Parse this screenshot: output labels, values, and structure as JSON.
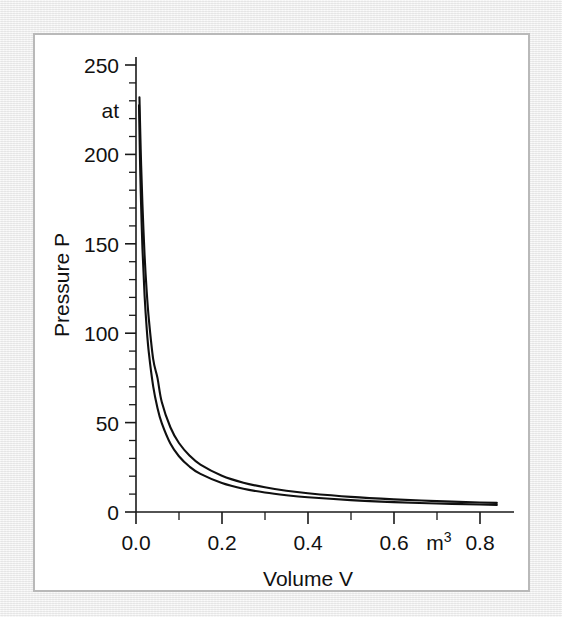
{
  "figure": {
    "background_color": "#ffffff",
    "frame_color": "#b9b9b9",
    "margin_color": "#eeeeee",
    "ink_color": "#101010"
  },
  "chart_data": {
    "type": "line",
    "title": "",
    "subtitle": "",
    "xlabel": "Volume V",
    "ylabel": "Pressure P",
    "x_unit": "m",
    "x_unit_exponent": "3",
    "y_unit": "at",
    "xlim": [
      0.0,
      0.88
    ],
    "ylim": [
      0,
      258
    ],
    "grid": false,
    "legend": "none",
    "x_ticks": [
      0.0,
      0.2,
      0.4,
      0.6,
      0.8
    ],
    "x_tick_labels": [
      "0.0",
      "0.2",
      "0.4",
      "0.6",
      "0.8"
    ],
    "x_minor_step": 0.1,
    "y_ticks": [
      0,
      50,
      100,
      150,
      200,
      250
    ],
    "y_tick_labels": [
      "0",
      "50",
      "100",
      "150",
      "200",
      "250"
    ],
    "y_minor_step": 10,
    "annotations": [
      {
        "text": "at",
        "role": "y-axis-unit",
        "x": 0.0,
        "y": 225
      },
      {
        "text": "m3",
        "role": "x-axis-unit",
        "x": 0.695,
        "y": 0
      }
    ],
    "series": [
      {
        "name": "isotherm-upper",
        "style": "solid",
        "color": "#101010",
        "relation": "P = 4.10 / (V + 0.0092)",
        "points": [
          [
            0.006,
            258.0
          ],
          [
            0.008,
            232.0
          ],
          [
            0.01,
            211.5
          ],
          [
            0.012,
            193.8
          ],
          [
            0.015,
            172.1
          ],
          [
            0.02,
            143.6
          ],
          [
            0.025,
            123.1
          ],
          [
            0.03,
            107.6
          ],
          [
            0.04,
            85.5
          ],
          [
            0.05,
            75.0
          ],
          [
            0.06,
            61.5
          ],
          [
            0.08,
            47.4
          ],
          [
            0.1,
            38.6
          ],
          [
            0.125,
            31.5
          ],
          [
            0.15,
            26.5
          ],
          [
            0.2,
            20.3
          ],
          [
            0.25,
            16.4
          ],
          [
            0.3,
            13.8
          ],
          [
            0.35,
            11.9
          ],
          [
            0.4,
            10.5
          ],
          [
            0.5,
            8.45
          ],
          [
            0.6,
            7.07
          ],
          [
            0.7,
            6.08
          ],
          [
            0.8,
            5.33
          ],
          [
            0.84,
            5.08
          ]
        ]
      },
      {
        "name": "isotherm-lower",
        "style": "solid",
        "color": "#101010",
        "relation": "P = 3.36 / (V + 0.0078)",
        "points": [
          [
            0.005,
            262.0
          ],
          [
            0.007,
            227.5
          ],
          [
            0.009,
            200.6
          ],
          [
            0.011,
            179.3
          ],
          [
            0.015,
            147.4
          ],
          [
            0.02,
            121.0
          ],
          [
            0.025,
            102.4
          ],
          [
            0.03,
            88.8
          ],
          [
            0.04,
            70.3
          ],
          [
            0.05,
            58.2
          ],
          [
            0.06,
            49.7
          ],
          [
            0.08,
            38.3
          ],
          [
            0.1,
            31.2
          ],
          [
            0.125,
            25.3
          ],
          [
            0.15,
            21.3
          ],
          [
            0.2,
            16.2
          ],
          [
            0.25,
            13.0
          ],
          [
            0.3,
            10.9
          ],
          [
            0.35,
            9.4
          ],
          [
            0.4,
            8.24
          ],
          [
            0.5,
            6.62
          ],
          [
            0.6,
            5.53
          ],
          [
            0.7,
            4.75
          ],
          [
            0.8,
            4.16
          ],
          [
            0.84,
            3.96
          ]
        ]
      }
    ]
  }
}
